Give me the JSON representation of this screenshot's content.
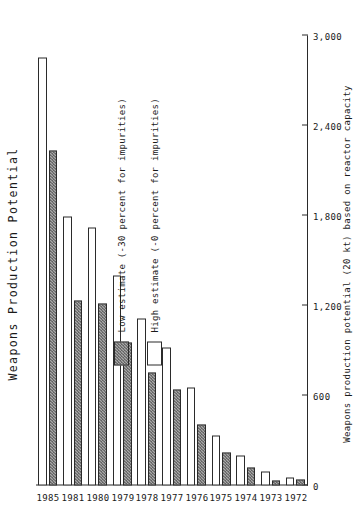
{
  "chart_data": {
    "type": "bar",
    "orientation": "horizontal",
    "title": "Weapons Production Potential",
    "xlabel": "Weapons production potential (20 kt) based on reactor capacity",
    "ylabel": "",
    "categories": [
      "1972",
      "1973",
      "1974",
      "1975",
      "1976",
      "1977",
      "1978",
      "1979",
      "1980",
      "1981",
      "1985"
    ],
    "tick_labels": [
      "0",
      "600",
      "1,200",
      "1,800",
      "2,400",
      "3,000"
    ],
    "tick_values": [
      0,
      600,
      1200,
      1800,
      2400,
      3000
    ],
    "xlim": [
      0,
      3000
    ],
    "grid": false,
    "legend_position": "upper-left",
    "series": [
      {
        "name": "High estimate (-0 percent for impurities)",
        "swatch": "white",
        "values": [
          55,
          95,
          200,
          330,
          655,
          920,
          1110,
          1400,
          1720,
          1790,
          2850
        ]
      },
      {
        "name": "Low estimate (-30 percent for impurities)",
        "swatch": "hatched",
        "values": [
          40,
          30,
          120,
          220,
          405,
          640,
          755,
          950,
          1210,
          1230,
          2230
        ]
      }
    ]
  },
  "legend": {
    "items": [
      {
        "label": "Low estimate (-30 percent for impurities)",
        "swatch": "low"
      },
      {
        "label": "High estimate (-0 percent for impurities)",
        "swatch": "high"
      }
    ]
  },
  "colors": {
    "ink": "#2b2b2b",
    "high_fill": "#ffffff",
    "low_fill": "#a9a9a9",
    "background": "#ffffff"
  }
}
